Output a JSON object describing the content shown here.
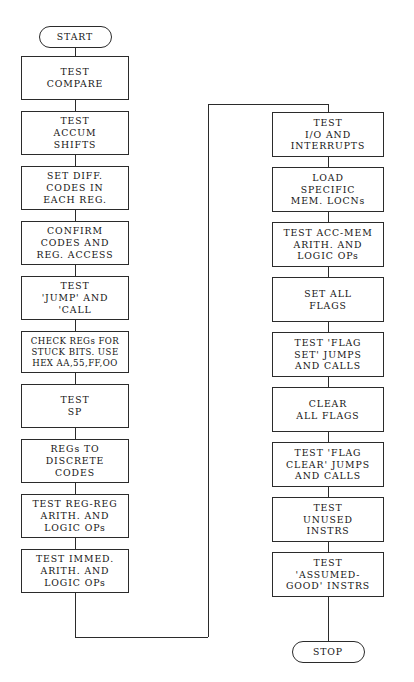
{
  "diagram": {
    "type": "flowchart",
    "orientation": "two-column, top-to-bottom, left column then right column",
    "line_color": "#2b2b2b",
    "background_color": "#ffffff",
    "nodes": [
      {
        "id": "start",
        "shape": "terminator",
        "column": "left",
        "lines": [
          "START"
        ]
      },
      {
        "id": "n01",
        "shape": "process",
        "column": "left",
        "lines": [
          "TEST",
          "COMPARE"
        ]
      },
      {
        "id": "n02",
        "shape": "process",
        "column": "left",
        "lines": [
          "TEST",
          "ACCUM",
          "SHIFTS"
        ]
      },
      {
        "id": "n03",
        "shape": "process",
        "column": "left",
        "lines": [
          "SET DIFF.",
          "CODES IN",
          "EACH REG."
        ]
      },
      {
        "id": "n04",
        "shape": "process",
        "column": "left",
        "lines": [
          "CONFIRM",
          "CODES AND",
          "REG. ACCESS"
        ]
      },
      {
        "id": "n05",
        "shape": "process",
        "column": "left",
        "lines": [
          "TEST",
          "'JUMP' AND",
          "'CALL"
        ]
      },
      {
        "id": "n06",
        "shape": "process",
        "column": "left",
        "lines": [
          "CHECK REGs FOR",
          "STUCK BITS. USE",
          "HEX AA,55,FF,OO"
        ]
      },
      {
        "id": "n07",
        "shape": "process",
        "column": "left",
        "lines": [
          "TEST",
          "SP"
        ]
      },
      {
        "id": "n08",
        "shape": "process",
        "column": "left",
        "lines": [
          "REGs TO",
          "DISCRETE",
          "CODES"
        ]
      },
      {
        "id": "n09",
        "shape": "process",
        "column": "left",
        "lines": [
          "TEST REG-REG",
          "ARITH. AND",
          "LOGIC OPs"
        ]
      },
      {
        "id": "n10",
        "shape": "process",
        "column": "left",
        "lines": [
          "TEST IMMED.",
          "ARITH. AND",
          "LOGIC OPs"
        ]
      },
      {
        "id": "n11",
        "shape": "process",
        "column": "right",
        "lines": [
          "TEST",
          "I/O AND",
          "INTERRUPTS"
        ]
      },
      {
        "id": "n12",
        "shape": "process",
        "column": "right",
        "lines": [
          "LOAD",
          "SPECIFIC",
          "MEM. LOCNs"
        ]
      },
      {
        "id": "n13",
        "shape": "process",
        "column": "right",
        "lines": [
          "TEST ACC-MEM",
          "ARITH. AND",
          "LOGIC OPs"
        ]
      },
      {
        "id": "n14",
        "shape": "process",
        "column": "right",
        "lines": [
          "SET ALL",
          "FLAGS"
        ]
      },
      {
        "id": "n15",
        "shape": "process",
        "column": "right",
        "lines": [
          "TEST 'FLAG",
          "SET' JUMPS",
          "AND CALLS"
        ]
      },
      {
        "id": "n16",
        "shape": "process",
        "column": "right",
        "lines": [
          "CLEAR",
          "ALL FLAGS"
        ]
      },
      {
        "id": "n17",
        "shape": "process",
        "column": "right",
        "lines": [
          "TEST 'FLAG",
          "CLEAR' JUMPS",
          "AND CALLS"
        ]
      },
      {
        "id": "n18",
        "shape": "process",
        "column": "right",
        "lines": [
          "TEST",
          "UNUSED",
          "INSTRS"
        ]
      },
      {
        "id": "n19",
        "shape": "process",
        "column": "right",
        "lines": [
          "TEST",
          "'ASSUMED-",
          "GOOD' INSTRS"
        ]
      },
      {
        "id": "stop",
        "shape": "terminator",
        "column": "right",
        "lines": [
          "STOP"
        ]
      }
    ]
  }
}
